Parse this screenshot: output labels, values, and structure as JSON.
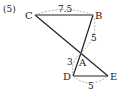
{
  "problem_number": "(5)",
  "points": {
    "C": {
      "label": "C",
      "x": 35,
      "y": 15
    },
    "B": {
      "label": "B",
      "x": 93,
      "y": 15
    },
    "A": {
      "label": "A",
      "x": 81,
      "y": 53
    },
    "D": {
      "label": "D",
      "x": 73,
      "y": 76
    },
    "E": {
      "label": "E",
      "x": 108,
      "y": 76
    }
  },
  "measurements": {
    "CB": "7.5",
    "BA": "5",
    "AD": "3",
    "DE": "5"
  },
  "colors": {
    "line": "#222222",
    "dashed": "#999999",
    "text": "#222222"
  }
}
